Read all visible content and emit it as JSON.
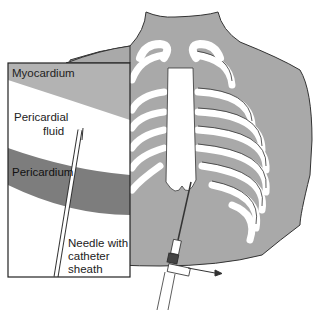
{
  "figure": {
    "colors": {
      "skin": "#a9a9a9",
      "bone": "#ffffff",
      "outline": "#333333",
      "myocardium": "#b3b3b3",
      "pericardium": "#7d7d7d",
      "fluid": "#ffffff"
    },
    "inset": {
      "labels": {
        "myocardium": "Myocardium",
        "pericardial_fluid_line1": "Pericardial",
        "pericardial_fluid_line2": "fluid",
        "pericardium": "Pericardium",
        "needle_line1": "Needle with",
        "needle_line2": "catheter",
        "needle_line3": "sheath"
      }
    }
  }
}
